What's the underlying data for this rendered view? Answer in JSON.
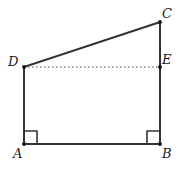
{
  "figure": {
    "kind": "plane-geometry-diagram",
    "canvas": {
      "width": 180,
      "height": 173,
      "background": "#ffffff"
    },
    "stroke_color": "#333333",
    "dotted_color": "#555555",
    "label_color": "#1a1a1a",
    "points": [
      {
        "id": "A",
        "label": "A",
        "x": 24,
        "y": 144,
        "label_x": 13,
        "label_y": 147,
        "marked": true
      },
      {
        "id": "B",
        "label": "B",
        "x": 160,
        "y": 144,
        "label_x": 162,
        "label_y": 147,
        "marked": true
      },
      {
        "id": "C",
        "label": "C",
        "x": 160,
        "y": 22,
        "label_x": 162,
        "label_y": 7,
        "marked": true
      },
      {
        "id": "D",
        "label": "D",
        "x": 24,
        "y": 67,
        "label_x": 8,
        "label_y": 55,
        "marked": true
      },
      {
        "id": "E",
        "label": "E",
        "x": 160,
        "y": 67,
        "label_x": 162,
        "label_y": 53,
        "marked": true
      }
    ],
    "segments": [
      {
        "id": "AB",
        "from": "A",
        "to": "B",
        "style": "solid",
        "width": 2
      },
      {
        "id": "AD",
        "from": "A",
        "to": "D",
        "style": "solid",
        "width": 2
      },
      {
        "id": "DC",
        "from": "D",
        "to": "C",
        "style": "solid",
        "width": 2
      },
      {
        "id": "CB",
        "from": "C",
        "to": "B",
        "style": "solid",
        "width": 2
      },
      {
        "id": "DE",
        "from": "D",
        "to": "E",
        "style": "dotted",
        "width": 1
      }
    ],
    "right_angles": [
      {
        "id": "angle-A",
        "at": "A",
        "size": 13,
        "dx": 1,
        "dy": -1
      },
      {
        "id": "angle-B",
        "at": "B",
        "size": 13,
        "dx": -1,
        "dy": -1
      }
    ]
  }
}
